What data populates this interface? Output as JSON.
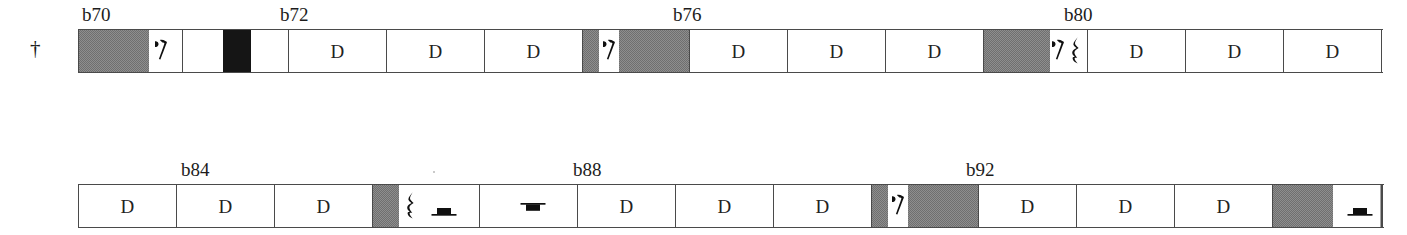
{
  "page": {
    "kind": "music-score-reduction",
    "background_color": "#ffffff",
    "ink_color": "#1c1c1c",
    "block_fill_color": "#8e8e8e",
    "block_dark_color": "#151515",
    "staff_line_color": "#4a4a4a"
  },
  "voice_marker": {
    "glyph": "†",
    "name": "dagger"
  },
  "systems": [
    {
      "id": "system-1",
      "bar_numbers": [
        {
          "label": "b70",
          "x": 82
        },
        {
          "label": "b72",
          "x": 280
        },
        {
          "label": "b76",
          "x": 673
        },
        {
          "label": "b80",
          "x": 1064
        },
        {
          "label": "",
          "x": 0
        }
      ],
      "measures": [
        {
          "index": 0,
          "label": "",
          "width": 104,
          "blocks": [
            {
              "x": 0,
              "width": 70,
              "shade": "gray"
            }
          ],
          "rests": [
            {
              "type": "eighth",
              "x": 76
            }
          ]
        },
        {
          "index": 1,
          "label": "",
          "width": 106,
          "blocks": [
            {
              "x": 40,
              "width": 28,
              "shade": "dark"
            }
          ],
          "rests": []
        },
        {
          "index": 2,
          "label": "D",
          "width": 98,
          "blocks": [],
          "rests": []
        },
        {
          "index": 3,
          "label": "D",
          "width": 98,
          "blocks": [],
          "rests": []
        },
        {
          "index": 4,
          "label": "D",
          "width": 98,
          "blocks": [],
          "rests": []
        },
        {
          "index": 5,
          "label": "",
          "width": 107,
          "blocks": [
            {
              "x": 0,
              "width": 16,
              "shade": "gray"
            },
            {
              "x": 36,
              "width": 70,
              "shade": "gray"
            }
          ],
          "rests": [
            {
              "type": "eighth",
              "x": 20
            }
          ]
        },
        {
          "index": 6,
          "label": "D",
          "width": 98,
          "blocks": [],
          "rests": []
        },
        {
          "index": 7,
          "label": "D",
          "width": 98,
          "blocks": [],
          "rests": []
        },
        {
          "index": 8,
          "label": "D",
          "width": 98,
          "blocks": [],
          "rests": []
        },
        {
          "index": 9,
          "label": "",
          "width": 104,
          "blocks": [
            {
              "x": 0,
              "width": 66,
              "shade": "gray"
            }
          ],
          "rests": [
            {
              "type": "eighth",
              "x": 68
            },
            {
              "type": "quarter",
              "x": 86
            }
          ]
        },
        {
          "index": 10,
          "label": "D",
          "width": 98,
          "blocks": [],
          "rests": []
        },
        {
          "index": 11,
          "label": "D",
          "width": 98,
          "blocks": [],
          "rests": []
        },
        {
          "index": 12,
          "label": "D",
          "width": 98,
          "blocks": [],
          "rests": []
        }
      ]
    },
    {
      "id": "system-2",
      "bar_numbers": [
        {
          "label": "b84",
          "x": 181
        },
        {
          "label": "b88",
          "x": 573
        },
        {
          "label": "b92",
          "x": 966
        }
      ],
      "measures": [
        {
          "index": 0,
          "label": "D",
          "width": 98,
          "blocks": [],
          "rests": []
        },
        {
          "index": 1,
          "label": "D",
          "width": 98,
          "blocks": [],
          "rests": []
        },
        {
          "index": 2,
          "label": "D",
          "width": 98,
          "blocks": [],
          "rests": []
        },
        {
          "index": 3,
          "label": "",
          "width": 107,
          "blocks": [
            {
              "x": 0,
              "width": 26,
              "shade": "gray"
            }
          ],
          "rests": [
            {
              "type": "quarter",
              "x": 32
            },
            {
              "type": "half",
              "x": 58
            }
          ]
        },
        {
          "index": 4,
          "label": "",
          "width": 98,
          "blocks": [],
          "rests": [
            {
              "type": "whole",
              "x": 40
            }
          ]
        },
        {
          "index": 5,
          "label": "D",
          "width": 98,
          "blocks": [],
          "rests": []
        },
        {
          "index": 6,
          "label": "D",
          "width": 98,
          "blocks": [],
          "rests": []
        },
        {
          "index": 7,
          "label": "D",
          "width": 98,
          "blocks": [],
          "rests": []
        },
        {
          "index": 8,
          "label": "",
          "width": 107,
          "blocks": [
            {
              "x": 0,
              "width": 16,
              "shade": "gray"
            },
            {
              "x": 36,
              "width": 70,
              "shade": "gray"
            }
          ],
          "rests": [
            {
              "type": "eighth",
              "x": 20
            }
          ]
        },
        {
          "index": 9,
          "label": "D",
          "width": 98,
          "blocks": [],
          "rests": []
        },
        {
          "index": 10,
          "label": "D",
          "width": 98,
          "blocks": [],
          "rests": []
        },
        {
          "index": 11,
          "label": "D",
          "width": 98,
          "blocks": [],
          "rests": []
        },
        {
          "index": 12,
          "label": "",
          "width": 110,
          "blocks": [
            {
              "x": 0,
              "width": 60,
              "shade": "gray"
            }
          ],
          "rests": [
            {
              "type": "half",
              "x": 74
            }
          ],
          "final_barline": true
        }
      ]
    }
  ]
}
